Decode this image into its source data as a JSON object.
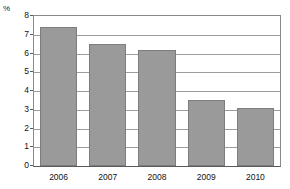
{
  "chart_data": {
    "type": "bar",
    "title": "",
    "xlabel": "",
    "ylabel": "%",
    "unit_label": "%",
    "categories": [
      "2006",
      "2007",
      "2008",
      "2009",
      "2010"
    ],
    "values": [
      7.4,
      6.5,
      6.2,
      3.5,
      3.1
    ],
    "series": [
      {
        "name": "",
        "values": [
          7.4,
          6.5,
          6.2,
          3.5,
          3.1
        ]
      }
    ],
    "ylim": [
      0,
      8
    ],
    "yticks": [
      0,
      1,
      2,
      3,
      4,
      5,
      6,
      7,
      8
    ],
    "ytick_labels": [
      "0",
      "1",
      "2",
      "3",
      "4",
      "5",
      "6",
      "7",
      "8"
    ],
    "grid": true,
    "grid_axis": "y",
    "legend": false,
    "legend_position": "none",
    "bar_color": "#9a9a9a",
    "bar_border_color": "#7d7d7d",
    "gridline_color": "#9c9c9c",
    "axis_color": "#5a5a5a",
    "text_color": "#111111",
    "background": "#ffffff"
  }
}
